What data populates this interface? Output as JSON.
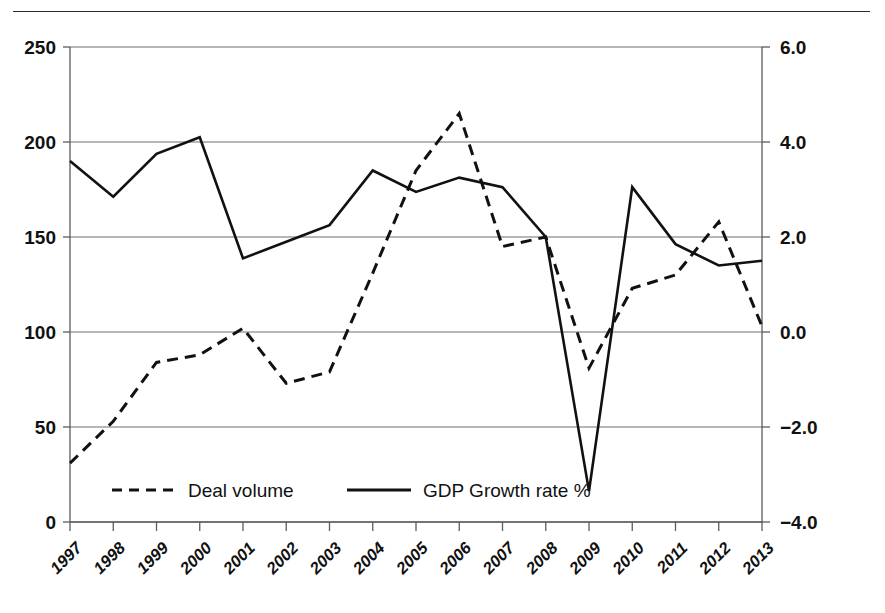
{
  "figure": {
    "has_top_rule": true,
    "background_color": "#ffffff",
    "line_color": "#111111",
    "grid_color": "#6e6e6e"
  },
  "chart_data": {
    "type": "line",
    "title": "",
    "subtitle": "",
    "xlabel": "",
    "ylabel": "",
    "y2label": "",
    "grid": true,
    "legend_position": "inside-bottom-left",
    "categories": [
      "1997",
      "1998",
      "1999",
      "2000",
      "2001",
      "2002",
      "2003",
      "2004",
      "2005",
      "2006",
      "2007",
      "2008",
      "2009",
      "2010",
      "2011",
      "2012",
      "2013"
    ],
    "x_tick_labels": [
      "1997",
      "1998",
      "1999",
      "2000",
      "2001",
      "2002",
      "2003",
      "2004",
      "2005",
      "2006",
      "2007",
      "2008",
      "2009",
      "2010",
      "2011",
      "2012",
      "2013"
    ],
    "y_tick_labels": [
      "0",
      "50",
      "100",
      "150",
      "200",
      "250"
    ],
    "y_tick_values": [
      0,
      50,
      100,
      150,
      200,
      250
    ],
    "ylim": [
      0,
      250
    ],
    "y2_tick_labels": [
      "−4.0",
      "−2.0",
      "0.0",
      "2.0",
      "4.0",
      "6.0"
    ],
    "y2_tick_values": [
      -4.0,
      -2.0,
      0.0,
      2.0,
      4.0,
      6.0
    ],
    "y2lim": [
      -4.0,
      6.0
    ],
    "series": [
      {
        "name": "Deal volume",
        "axis": "left",
        "style": "dashed",
        "values": [
          31,
          53,
          84,
          88,
          102,
          73,
          79,
          131,
          185,
          215,
          145,
          150,
          81,
          123,
          130,
          158,
          103
        ]
      },
      {
        "name": "GDP Growth rate %",
        "axis": "right",
        "style": "solid",
        "values": [
          3.6,
          2.85,
          3.75,
          4.1,
          1.55,
          1.9,
          2.25,
          3.4,
          2.95,
          3.25,
          3.05,
          2.0,
          -3.35,
          3.05,
          1.85,
          1.4,
          1.5
        ]
      }
    ],
    "legend": [
      {
        "label": "Deal volume",
        "style": "dashed"
      },
      {
        "label": "GDP Growth rate %",
        "style": "solid"
      }
    ]
  }
}
